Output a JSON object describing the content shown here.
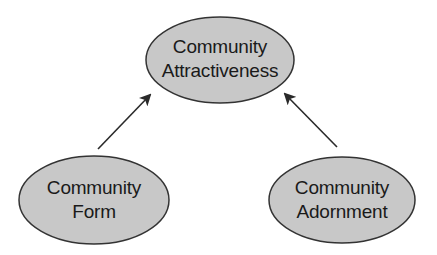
{
  "diagram": {
    "type": "concept-diagram",
    "colors": {
      "node_fill": "#c8c8c8",
      "node_stroke": "#333333",
      "arrow": "#2a2a2a",
      "text": "#1a1a1a",
      "background": "#ffffff"
    },
    "nodes": [
      {
        "id": "attractiveness",
        "lines": [
          "Community",
          "Attractiveness"
        ],
        "cx": 220,
        "cy": 60,
        "rx": 74,
        "ry": 43
      },
      {
        "id": "form",
        "lines": [
          "Community",
          "Form"
        ],
        "cx": 94,
        "cy": 200,
        "rx": 75,
        "ry": 44
      },
      {
        "id": "adornment",
        "lines": [
          "Community",
          "Adornment"
        ],
        "cx": 342,
        "cy": 200,
        "rx": 73,
        "ry": 43
      }
    ],
    "edges": [
      {
        "from": "form",
        "to": "attractiveness"
      },
      {
        "from": "adornment",
        "to": "attractiveness"
      }
    ]
  }
}
